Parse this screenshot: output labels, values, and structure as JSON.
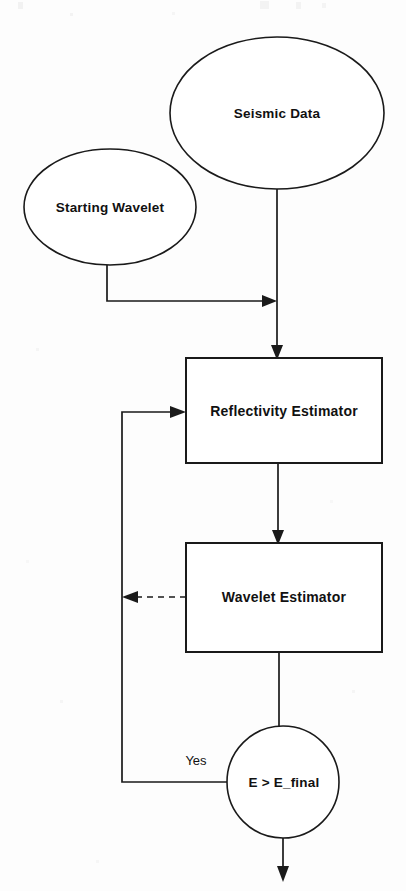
{
  "diagram": {
    "background_color": "#fdfdfd",
    "stroke_color": "#1a1a1a",
    "text_color": "#111111",
    "nodes": [
      {
        "id": "seismic-data",
        "label": "Seismic Data",
        "shape": "ellipse",
        "cx": 277,
        "cy": 113,
        "rx": 107,
        "ry": 76
      },
      {
        "id": "starting-wavelet",
        "label": "Starting Wavelet",
        "shape": "ellipse",
        "cx": 110,
        "cy": 207,
        "rx": 86,
        "ry": 58
      },
      {
        "id": "reflectivity-estimator",
        "label": "Reflectivity Estimator",
        "shape": "rect",
        "x": 186,
        "y": 358,
        "w": 196,
        "h": 105
      },
      {
        "id": "wavelet-estimator",
        "label": "Wavelet Estimator",
        "shape": "rect",
        "x": 186,
        "y": 543,
        "w": 196,
        "h": 109
      },
      {
        "id": "convergence-test",
        "label": "E > E_final",
        "shape": "circle",
        "cx": 283,
        "cy": 782,
        "r": 56
      }
    ],
    "edges": [
      {
        "id": "seismic-to-reflectivity",
        "from": "seismic-data",
        "to": "reflectivity-estimator",
        "style": "solid",
        "arrow": "down"
      },
      {
        "id": "wavelet-to-reflectivity",
        "from": "starting-wavelet",
        "to": "reflectivity-estimator-input",
        "style": "solid",
        "arrow": "right"
      },
      {
        "id": "reflectivity-to-wavelet-estimator",
        "from": "reflectivity-estimator",
        "to": "wavelet-estimator",
        "style": "solid",
        "arrow": "down"
      },
      {
        "id": "wavelet-estimator-feedback",
        "from": "wavelet-estimator",
        "to": "feedback-bus",
        "style": "dashed",
        "arrow": "left"
      },
      {
        "id": "wavelet-estimator-to-test",
        "from": "wavelet-estimator",
        "to": "convergence-test",
        "style": "solid",
        "arrow": "none"
      },
      {
        "id": "test-yes-loop",
        "from": "convergence-test",
        "to": "reflectivity-estimator",
        "style": "solid",
        "arrow": "right",
        "label": "Yes"
      },
      {
        "id": "test-exit",
        "from": "convergence-test",
        "to": "output",
        "style": "solid",
        "arrow": "down"
      }
    ],
    "edge_labels": [
      {
        "id": "yes-label",
        "text": "Yes",
        "x": 196,
        "y": 762
      }
    ]
  }
}
